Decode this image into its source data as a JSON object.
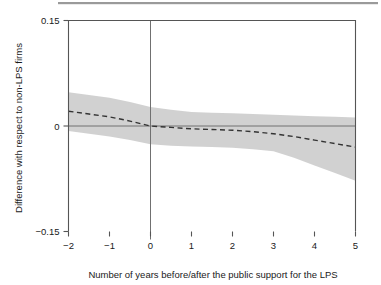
{
  "chart_data": {
    "type": "line",
    "title": "",
    "xlabel": "Number of years before/after the public support for the LPS",
    "ylabel": "Difference with respect to non-LPS firms",
    "xlim": [
      -2,
      5
    ],
    "ylim": [
      -0.15,
      0.15
    ],
    "xticks": [
      -2,
      -1,
      0,
      1,
      2,
      3,
      4,
      5
    ],
    "xtick_labels": [
      "−2",
      "−1",
      "0",
      "1",
      "2",
      "3",
      "4",
      "5"
    ],
    "yticks": [
      0.15,
      0,
      -0.15
    ],
    "ytick_labels": [
      "0.15",
      "0",
      "−0.15"
    ],
    "grid": false,
    "legend": null,
    "reference_lines": [
      {
        "name": "treatment-year-vline",
        "orientation": "vertical",
        "value": 0,
        "color": "#707070"
      },
      {
        "name": "zero-effect-hline",
        "orientation": "horizontal",
        "value": 0,
        "color": "#707070"
      }
    ],
    "series": [
      {
        "name": "Estimated difference",
        "style": "dashed",
        "color": "#333333",
        "x": [
          -2,
          -1.5,
          -1,
          -0.5,
          0,
          0.5,
          1,
          1.5,
          2,
          2.5,
          3,
          3.5,
          4,
          4.5,
          5
        ],
        "values": [
          0.021,
          0.017,
          0.013,
          0.007,
          0.0,
          -0.002,
          -0.004,
          -0.005,
          -0.006,
          -0.008,
          -0.011,
          -0.015,
          -0.02,
          -0.025,
          -0.03
        ]
      },
      {
        "name": "Confidence band upper",
        "style": "band",
        "color": "#c9c9c9",
        "x": [
          -2,
          -1.5,
          -1,
          -0.5,
          0,
          0.5,
          1,
          1.5,
          2,
          2.5,
          3,
          3.5,
          4,
          4.5,
          5
        ],
        "values": [
          0.048,
          0.044,
          0.04,
          0.034,
          0.027,
          0.023,
          0.02,
          0.019,
          0.018,
          0.017,
          0.016,
          0.015,
          0.014,
          0.013,
          0.012
        ]
      },
      {
        "name": "Confidence band lower",
        "style": "band",
        "color": "#c9c9c9",
        "x": [
          -2,
          -1.5,
          -1,
          -0.5,
          0,
          0.5,
          1,
          1.5,
          2,
          2.5,
          3,
          3.5,
          4,
          4.5,
          5
        ],
        "values": [
          -0.007,
          -0.011,
          -0.015,
          -0.02,
          -0.026,
          -0.028,
          -0.029,
          -0.03,
          -0.031,
          -0.033,
          -0.036,
          -0.045,
          -0.056,
          -0.067,
          -0.078
        ]
      }
    ]
  },
  "figure": {
    "background_color": "#ffffff",
    "frame_color": "#555555",
    "band_color": "#c9c9c9",
    "line_color": "#333333"
  }
}
